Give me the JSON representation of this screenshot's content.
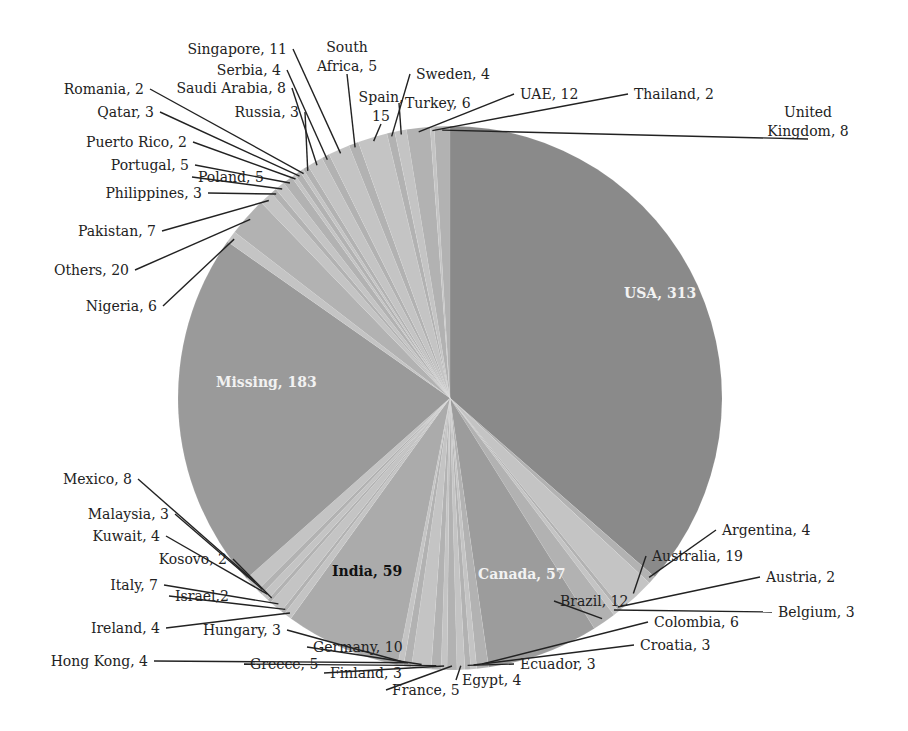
{
  "chart_data": {
    "type": "pie",
    "title": "",
    "center": [
      450,
      398
    ],
    "radius": 272,
    "start_angle_deg": -90,
    "colors": {
      "USA": "#8a8a8a",
      "Missing": "#9a9a9a",
      "India": "#ababab",
      "Canada": "#9c9c9c",
      "small_light": "#c4c4c4",
      "small_mid": "#b2b2b2",
      "leader_line": "#222222"
    },
    "slices": [
      {
        "label": "USA",
        "value": 313,
        "inner": true,
        "text": "USA, 313",
        "tx": 624,
        "ty": 298,
        "color": "#8a8a8a",
        "text_color": "#f2f2f2"
      },
      {
        "label": "Argentina",
        "value": 4,
        "text": "Argentina, 4",
        "tx": 722,
        "ty": 535,
        "anchor": "start"
      },
      {
        "label": "Australia",
        "value": 19,
        "text": "Australia, 19",
        "tx": 652,
        "ty": 561,
        "anchor": "start"
      },
      {
        "label": "Austria",
        "value": 2,
        "text": "Austria, 2",
        "tx": 766,
        "ty": 582,
        "anchor": "start"
      },
      {
        "label": "Belgium",
        "value": 3,
        "text": "Belgium, 3",
        "tx": 778,
        "ty": 617,
        "anchor": "start"
      },
      {
        "label": "Brazil",
        "value": 12,
        "text": "Brazil, 12",
        "tx": 560,
        "ty": 606,
        "anchor": "start"
      },
      {
        "label": "Canada",
        "value": 57,
        "inner": true,
        "text": "Canada, 57",
        "tx": 478,
        "ty": 579,
        "color": "#9c9c9c",
        "text_color": "#f2f2f2"
      },
      {
        "label": "Colombia",
        "value": 6,
        "text": "Colombia, 6",
        "tx": 654,
        "ty": 627,
        "anchor": "start"
      },
      {
        "label": "Croatia",
        "value": 3,
        "text": "Croatia, 3",
        "tx": 640,
        "ty": 650,
        "anchor": "start"
      },
      {
        "label": "Ecuador",
        "value": 3,
        "text": "Ecuador, 3",
        "tx": 520,
        "ty": 669,
        "anchor": "start"
      },
      {
        "label": "Egypt",
        "value": 4,
        "text": "Egypt, 4",
        "tx": 462,
        "ty": 685,
        "anchor": "start"
      },
      {
        "label": "France",
        "value": 5,
        "text": "France, 5",
        "tx": 392,
        "ty": 695,
        "anchor": "start"
      },
      {
        "label": "Finland",
        "value": 3,
        "text": "Finland, 3",
        "tx": 330,
        "ty": 678,
        "anchor": "start"
      },
      {
        "label": "Greece",
        "value": 5,
        "text": "Greece, 5",
        "tx": 250,
        "ty": 669,
        "anchor": "start"
      },
      {
        "label": "Germany",
        "value": 10,
        "text": "Germany, 10",
        "tx": 313,
        "ty": 652,
        "anchor": "start"
      },
      {
        "label": "Hong Kong",
        "value": 4,
        "text": "Hong Kong, 4",
        "tx": 148,
        "ty": 666,
        "anchor": "end"
      },
      {
        "label": "Hungary",
        "value": 3,
        "text": "Hungary, 3",
        "tx": 281,
        "ty": 635,
        "anchor": "end"
      },
      {
        "label": "India",
        "value": 59,
        "inner": true,
        "text": "India, 59",
        "tx": 332,
        "ty": 576,
        "color": "#ababab",
        "text_color": "#111111"
      },
      {
        "label": "Ireland",
        "value": 4,
        "text": "Ireland, 4",
        "tx": 160,
        "ty": 633,
        "anchor": "end"
      },
      {
        "label": "Israel",
        "value": 2,
        "text": "Israel,2",
        "tx": 175,
        "ty": 601,
        "anchor": "start"
      },
      {
        "label": "Italy",
        "value": 7,
        "text": "Italy, 7",
        "tx": 158,
        "ty": 590,
        "anchor": "end"
      },
      {
        "label": "Kosovo",
        "value": 2,
        "text": "Kosovo, 2",
        "tx": 227,
        "ty": 564,
        "anchor": "end"
      },
      {
        "label": "Kuwait",
        "value": 4,
        "text": "Kuwait, 4",
        "tx": 160,
        "ty": 541,
        "anchor": "end"
      },
      {
        "label": "Malaysia",
        "value": 3,
        "text": "Malaysia, 3",
        "tx": 169,
        "ty": 519,
        "anchor": "end"
      },
      {
        "label": "Mexico",
        "value": 8,
        "text": "Mexico, 8",
        "tx": 132,
        "ty": 484,
        "anchor": "end"
      },
      {
        "label": "Missing",
        "value": 183,
        "inner": true,
        "text": "Missing, 183",
        "tx": 216,
        "ty": 387,
        "color": "#9a9a9a",
        "text_color": "#f2f2f2"
      },
      {
        "label": "Nigeria",
        "value": 6,
        "text": "Nigeria, 6",
        "tx": 157,
        "ty": 311,
        "anchor": "end"
      },
      {
        "label": "Others",
        "value": 20,
        "text": "Others, 20",
        "tx": 129,
        "ty": 275,
        "anchor": "end"
      },
      {
        "label": "Pakistan",
        "value": 7,
        "text": "Pakistan, 7",
        "tx": 156,
        "ty": 236,
        "anchor": "end"
      },
      {
        "label": "Philippines",
        "value": 3,
        "text": "Philippines, 3",
        "tx": 202,
        "ty": 198,
        "anchor": "end"
      },
      {
        "label": "Poland",
        "value": 5,
        "text": "Poland, 5",
        "tx": 198,
        "ty": 182,
        "anchor": "start"
      },
      {
        "label": "Portugal",
        "value": 5,
        "text": "Portugal, 5",
        "tx": 189,
        "ty": 170,
        "anchor": "end"
      },
      {
        "label": "Puerto Rico",
        "value": 2,
        "text": "Puerto Rico, 2",
        "tx": 187,
        "ty": 147,
        "anchor": "end"
      },
      {
        "label": "Qatar",
        "value": 3,
        "text": "Qatar, 3",
        "tx": 154,
        "ty": 117,
        "anchor": "end"
      },
      {
        "label": "Romania",
        "value": 2,
        "text": "Romania, 2",
        "tx": 144,
        "ty": 94,
        "anchor": "end"
      },
      {
        "label": "Russia",
        "value": 3,
        "text": "Russia, 3",
        "tx": 299,
        "ty": 117,
        "anchor": "end"
      },
      {
        "label": "Saudi Arabia",
        "value": 8,
        "text": "Saudi Arabia, 8",
        "tx": 286,
        "ty": 93,
        "anchor": "end"
      },
      {
        "label": "Serbia",
        "value": 4,
        "text": "Serbia, 4",
        "tx": 281,
        "ty": 75,
        "anchor": "end"
      },
      {
        "label": "Singapore",
        "value": 11,
        "text": "Singapore, 11",
        "tx": 287,
        "ty": 54,
        "anchor": "end"
      },
      {
        "label": "South Africa",
        "value": 5,
        "text": "South",
        "text2": "Africa, 5",
        "tx": 347,
        "ty": 52,
        "anchor": "middle"
      },
      {
        "label": "Spain",
        "value": 15,
        "text": "Spain,",
        "text2": "15",
        "tx": 381,
        "ty": 102,
        "anchor": "middle"
      },
      {
        "label": "Sweden",
        "value": 4,
        "text": "Sweden, 4",
        "tx": 416,
        "ty": 79,
        "anchor": "start"
      },
      {
        "label": "Turkey",
        "value": 6,
        "text": "Turkey, 6",
        "tx": 405,
        "ty": 108,
        "anchor": "start"
      },
      {
        "label": "UAE",
        "value": 12,
        "text": "UAE, 12",
        "tx": 520,
        "ty": 99,
        "anchor": "start"
      },
      {
        "label": "Thailand",
        "value": 2,
        "text": "Thailand, 2",
        "tx": 634,
        "ty": 99,
        "anchor": "start"
      },
      {
        "label": "United Kingdom",
        "value": 8,
        "text": "United",
        "text2": "Kingdom, 8",
        "tx": 808,
        "ty": 117,
        "anchor": "middle"
      }
    ],
    "legend": null
  }
}
